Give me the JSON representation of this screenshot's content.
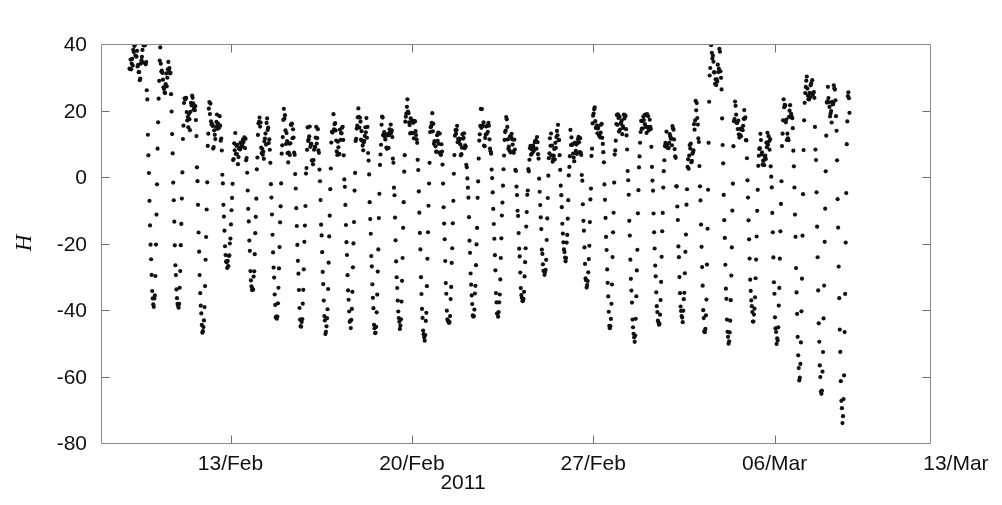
{
  "chart_data": {
    "type": "scatter",
    "title": "",
    "subtitle": "",
    "xlabel": "2011",
    "ylabel": "H",
    "ylabel_style": "italic",
    "grid": false,
    "legend": null,
    "marker": {
      "shape": "dot",
      "size": 2.1,
      "color": "#111111"
    },
    "background": "#ffffff",
    "axis_color": "#8a8a8a",
    "xlim": [
      39.0,
      71.0
    ],
    "xlim_note": "day-of-year 2011; 44 = 13/Feb, 72 = 13/Mar",
    "x_ticks": [
      44,
      51,
      58,
      65,
      72
    ],
    "x_tick_labels": [
      "13/Feb",
      "20/Feb",
      "27/Feb",
      "06/Mar",
      "13/Mar"
    ],
    "ylim": [
      -80,
      40
    ],
    "y_ticks": [
      40,
      20,
      0,
      -20,
      -40,
      -60,
      -80
    ],
    "y_tick_labels": [
      "40",
      "20",
      "0",
      "-20",
      "-40",
      "-60",
      "-80"
    ],
    "series_name": "H",
    "sampling_per_day": 48,
    "data_start_day": 40.1,
    "data_end_day": 67.9,
    "value_range_observed": [
      -75,
      40
    ],
    "cycles": [
      {
        "day": 40.35,
        "peak": 38,
        "trough": -33
      },
      {
        "day": 41.3,
        "peak": 37,
        "trough": -41
      },
      {
        "day": 42.25,
        "peak": 24,
        "trough": -40
      },
      {
        "day": 43.2,
        "peak": 20,
        "trough": -49
      },
      {
        "day": 44.2,
        "peak": 10,
        "trough": -17
      },
      {
        "day": 45.1,
        "peak": 14,
        "trough": -40
      },
      {
        "day": 46.05,
        "peak": 15,
        "trough": -42
      },
      {
        "day": 47.0,
        "peak": 12,
        "trough": -44
      },
      {
        "day": 47.95,
        "peak": 14,
        "trough": -46
      },
      {
        "day": 48.9,
        "peak": 17,
        "trough": -43
      },
      {
        "day": 49.85,
        "peak": 14,
        "trough": -48
      },
      {
        "day": 50.8,
        "peak": 20,
        "trough": -44
      },
      {
        "day": 51.75,
        "peak": 15,
        "trough": -52
      },
      {
        "day": 52.7,
        "peak": 12,
        "trough": -43
      },
      {
        "day": 53.65,
        "peak": 16,
        "trough": -41
      },
      {
        "day": 54.6,
        "peak": 14,
        "trough": -42
      },
      {
        "day": 55.55,
        "peak": 8,
        "trough": -36
      },
      {
        "day": 56.35,
        "peak": 12,
        "trough": -29
      },
      {
        "day": 57.15,
        "peak": 10,
        "trough": -22
      },
      {
        "day": 58.0,
        "peak": 16,
        "trough": -38
      },
      {
        "day": 58.9,
        "peak": 18,
        "trough": -48
      },
      {
        "day": 59.85,
        "peak": 19,
        "trough": -50
      },
      {
        "day": 60.8,
        "peak": 14,
        "trough": -44
      },
      {
        "day": 61.7,
        "peak": 8,
        "trough": -44
      },
      {
        "day": 62.55,
        "peak": 40,
        "trough": -48
      },
      {
        "day": 63.5,
        "peak": 21,
        "trough": -50
      },
      {
        "day": 64.45,
        "peak": 9,
        "trough": -41
      },
      {
        "day": 65.35,
        "peak": 19,
        "trough": -53
      },
      {
        "day": 66.2,
        "peak": 30,
        "trough": -62
      },
      {
        "day": 67.05,
        "peak": 26,
        "trough": -68
      },
      {
        "day": 67.85,
        "peak": 22,
        "trough": -75
      }
    ]
  },
  "axes": {
    "y_label": "H",
    "x_label": "2011",
    "y_tick_labels": [
      "40",
      "20",
      "0",
      "-20",
      "-40",
      "-60",
      "-80"
    ],
    "x_tick_labels": [
      "13/Feb",
      "20/Feb",
      "27/Feb",
      "06/Mar",
      "13/Mar"
    ]
  }
}
